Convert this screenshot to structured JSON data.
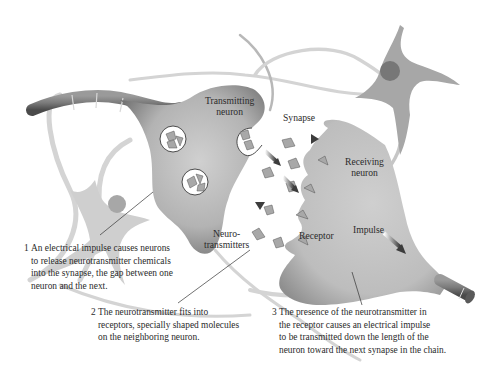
{
  "diagram": {
    "labels": {
      "transmitting_neuron": [
        "Transmitting",
        "neuron"
      ],
      "synapse": "Synapse",
      "receiving_neuron": [
        "Receiving",
        "neuron"
      ],
      "neurotransmitters": [
        "Neuro-",
        "transmitters"
      ],
      "receptor": "Receptor",
      "impulse": "Impulse"
    },
    "captions": [
      {
        "number": "1",
        "lines": [
          "An electrical impulse causes neurons",
          "to release neurotransmitter chemicals",
          "into the synapse, the gap between one",
          "neuron and the next."
        ]
      },
      {
        "number": "2",
        "lines": [
          "The neurotransmitter fits into",
          "receptors, specially shaped molecules",
          "on the neighboring neuron."
        ]
      },
      {
        "number": "3",
        "lines": [
          "The presence of the neurotransmitter in",
          "the receptor causes an electrical impulse",
          "to be transmitted down the length of the",
          "neuron toward the next synapse in the chain."
        ]
      }
    ],
    "colors": {
      "neuron_fill": "#b8b8b8",
      "neuron_dark": "#6e6e6e",
      "background_neuron": "#a9a9a9",
      "background_dendrite": "#d2d2d2",
      "nucleus": "#7a7a7a",
      "arrow": "#555555",
      "text": "#2b2b2b"
    }
  }
}
